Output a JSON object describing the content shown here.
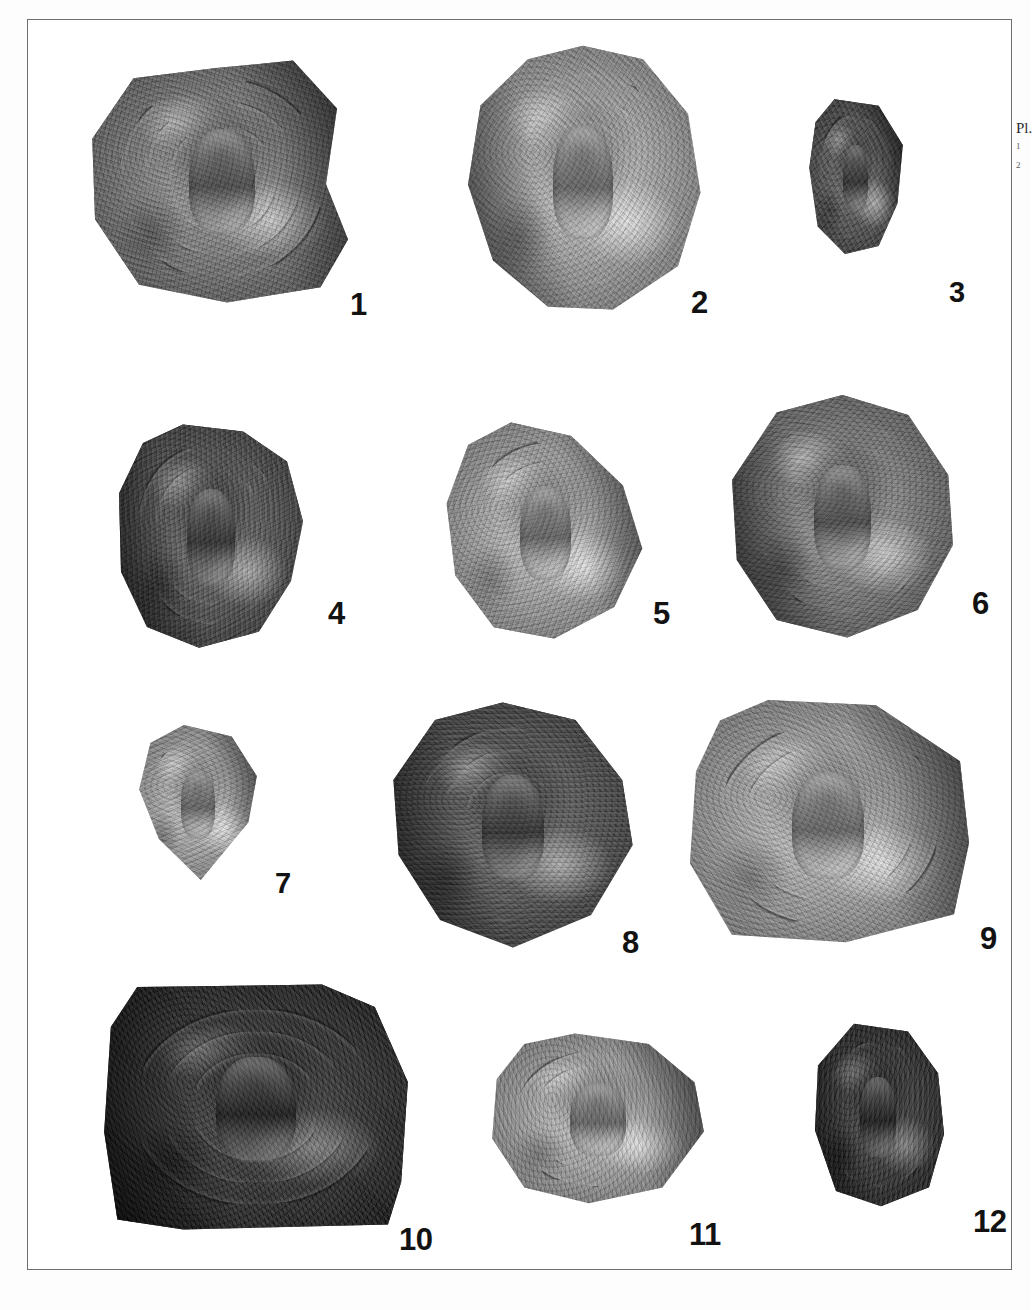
{
  "page": {
    "kind": "photographic-plate",
    "background_color": "#ffffff",
    "frame_color": "#6e6e6e",
    "label_color": "#121212"
  },
  "caption": {
    "title": "Pl.",
    "lines": [
      "1",
      "2"
    ]
  },
  "plate": {
    "columns": 3,
    "rows": 4,
    "specimens": [
      {
        "number": "1",
        "label_x": 322,
        "label_y": 269,
        "label_size": 31,
        "x": 56,
        "y": 33,
        "w": 275,
        "h": 252,
        "tone": "mid",
        "shape": "round-chipped-right",
        "rings": 3,
        "ring_tilt": -8
      },
      {
        "number": "2",
        "label_x": 663,
        "label_y": 267,
        "label_size": 31,
        "x": 430,
        "y": 23,
        "w": 250,
        "h": 272,
        "tone": "light",
        "shape": "ovoid",
        "rings": 3,
        "ring_tilt": 4
      },
      {
        "number": "3",
        "label_x": 921,
        "label_y": 258,
        "label_size": 29,
        "x": 775,
        "y": 76,
        "w": 105,
        "h": 163,
        "tone": "dark",
        "shape": "fragment",
        "rings": 1,
        "ring_tilt": 0
      },
      {
        "number": "4",
        "label_x": 300,
        "label_y": 578,
        "label_size": 31,
        "x": 83,
        "y": 400,
        "w": 200,
        "h": 230,
        "tone": "dark",
        "shape": "polygonal",
        "rings": 2,
        "ring_tilt": -5
      },
      {
        "number": "5",
        "label_x": 625,
        "label_y": 578,
        "label_size": 31,
        "x": 410,
        "y": 398,
        "w": 215,
        "h": 225,
        "tone": "light",
        "shape": "teardrop",
        "rings": 2,
        "ring_tilt": 10
      },
      {
        "number": "6",
        "label_x": 944,
        "label_y": 568,
        "label_size": 31,
        "x": 697,
        "y": 370,
        "w": 235,
        "h": 250,
        "tone": "mid",
        "shape": "round",
        "rings": 2,
        "ring_tilt": -3
      },
      {
        "number": "7",
        "label_x": 247,
        "label_y": 849,
        "label_size": 29,
        "x": 100,
        "y": 700,
        "w": 140,
        "h": 165,
        "tone": "light",
        "shape": "hex",
        "rings": 1,
        "ring_tilt": 0
      },
      {
        "number": "8",
        "label_x": 594,
        "label_y": 907,
        "label_size": 31,
        "x": 355,
        "y": 680,
        "w": 260,
        "h": 250,
        "tone": "dark",
        "shape": "lozenge",
        "rings": 3,
        "ring_tilt": 6
      },
      {
        "number": "9",
        "label_x": 952,
        "label_y": 903,
        "label_size": 31,
        "x": 650,
        "y": 675,
        "w": 300,
        "h": 255,
        "tone": "light",
        "shape": "angular",
        "rings": 2,
        "ring_tilt": -10
      },
      {
        "number": "10",
        "label_x": 371,
        "label_y": 1204,
        "label_size": 31,
        "x": 63,
        "y": 962,
        "w": 330,
        "h": 250,
        "tone": "darkest",
        "shape": "shield",
        "rings": 3,
        "ring_tilt": 0
      },
      {
        "number": "11",
        "label_x": 661,
        "label_y": 1199,
        "label_size": 31,
        "x": 455,
        "y": 1010,
        "w": 230,
        "h": 175,
        "tone": "light",
        "shape": "round-flat-base",
        "rings": 2,
        "ring_tilt": -4
      },
      {
        "number": "12",
        "label_x": 945,
        "label_y": 1186,
        "label_size": 31,
        "x": 775,
        "y": 1000,
        "w": 150,
        "h": 190,
        "tone": "darkest",
        "shape": "blob",
        "rings": 1,
        "ring_tilt": 0
      }
    ]
  }
}
